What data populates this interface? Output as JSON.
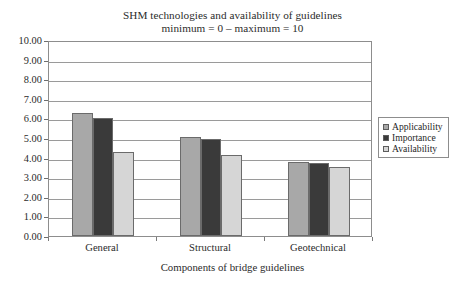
{
  "chart_data": {
    "type": "bar",
    "title": "SHM technologies and availability of guidelines",
    "subtitle": "minimum = 0 – maximum = 10",
    "xlabel": "Components of bridge guidelines",
    "ylabel": "",
    "categories": [
      "General",
      "Structural",
      "Geotechnical"
    ],
    "series": [
      {
        "name": "Applicability",
        "values": [
          6.3,
          5.05,
          3.8
        ],
        "color": "#a8a8a8"
      },
      {
        "name": "Importance",
        "values": [
          6.0,
          4.95,
          3.7
        ],
        "color": "#3a3a3a"
      },
      {
        "name": "Availability",
        "values": [
          4.3,
          4.15,
          3.5
        ],
        "color": "#d6d6d6"
      }
    ],
    "ylim": [
      0,
      10
    ],
    "ytick_step": 1,
    "ytick_labels": [
      "10.00",
      "9.00",
      "8.00",
      "7.00",
      "6.00",
      "5.00",
      "4.00",
      "3.00",
      "2.00",
      "1.00",
      "0.00"
    ],
    "grid": true,
    "legend_position": "right",
    "bar_border_color": "#6b6b6b",
    "axis_color": "#8d8d8d",
    "grid_color": "#9a9a9a",
    "text_color": "#2b2b2b"
  }
}
